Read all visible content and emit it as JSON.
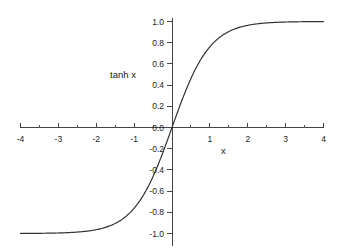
{
  "chart_data": {
    "type": "line",
    "title": "",
    "subtitle": "",
    "xlabel": "x",
    "ylabel": "tanh x",
    "xlim": [
      -4,
      4
    ],
    "ylim": [
      -1.0,
      1.0
    ],
    "grid": false,
    "legend": false,
    "legend_position": "none",
    "series_name": "tanh x",
    "series_color": "#333333",
    "xticks": [
      -4,
      -3,
      -2,
      -1,
      1,
      2,
      3,
      4
    ],
    "xticklabels": [
      "-4",
      "-3",
      "-2",
      "-1",
      "1",
      "2",
      "3",
      "4"
    ],
    "xminorticks": [
      -3.5,
      -2.5,
      -1.5,
      -0.5,
      0.5,
      1.5,
      2.5,
      3.5
    ],
    "yticks": [
      1.0,
      0.8,
      0.6,
      0.4,
      0.2,
      0.0,
      -0.2,
      -0.4,
      -0.6,
      -0.8,
      -1.0
    ],
    "yticklabels": [
      "1.0",
      "0.8",
      "0.6",
      "0.4",
      "0.2",
      "0.0",
      "-0.2",
      "-0.4",
      "-0.6",
      "-0.8",
      "-1.0"
    ],
    "x": [
      -4.0,
      -3.8,
      -3.6,
      -3.4,
      -3.2,
      -3.0,
      -2.8,
      -2.6,
      -2.4,
      -2.2,
      -2.0,
      -1.8,
      -1.6,
      -1.4,
      -1.2,
      -1.0,
      -0.8,
      -0.6,
      -0.4,
      -0.2,
      0.0,
      0.2,
      0.4,
      0.6,
      0.8,
      1.0,
      1.2,
      1.4,
      1.6,
      1.8,
      2.0,
      2.2,
      2.4,
      2.6,
      2.8,
      3.0,
      3.2,
      3.4,
      3.6,
      3.8,
      4.0
    ],
    "values": [
      -0.9993,
      -0.999,
      -0.9985,
      -0.9978,
      -0.9967,
      -0.9951,
      -0.9926,
      -0.989,
      -0.9837,
      -0.9757,
      -0.964,
      -0.9468,
      -0.9217,
      -0.8854,
      -0.8337,
      -0.7616,
      -0.664,
      -0.537,
      -0.3799,
      -0.1974,
      0.0,
      0.1974,
      0.3799,
      0.537,
      0.664,
      0.7616,
      0.8337,
      0.8854,
      0.9217,
      0.9468,
      0.964,
      0.9757,
      0.9837,
      0.989,
      0.9926,
      0.9951,
      0.9967,
      0.9978,
      0.9985,
      0.999,
      0.9993
    ]
  },
  "axes": {
    "y_axis_name": "tanh x",
    "x_axis_name": "x"
  },
  "colors": {
    "background": "#ffffff",
    "axis": "#444444",
    "curve": "#333333",
    "text": "#1a1a1a"
  }
}
